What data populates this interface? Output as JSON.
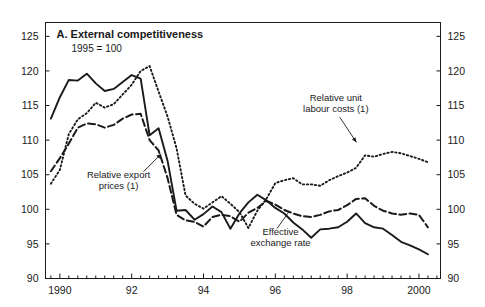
{
  "chart_data": {
    "type": "line",
    "title": "A. External competitiveness",
    "subtitle": "1995 = 100",
    "xlabel": "",
    "ylabel": "",
    "xlim": [
      1989.6,
      2000.6
    ],
    "ylim": [
      90,
      127
    ],
    "y_ticks": [
      90,
      95,
      100,
      105,
      110,
      115,
      120,
      125
    ],
    "y_tick_labels": [
      "90",
      "95",
      "100",
      "105",
      "110",
      "115",
      "120",
      "125"
    ],
    "x_ticks": [
      1990,
      1992,
      1994,
      1996,
      1998,
      2000
    ],
    "x_tick_labels": [
      "1990",
      "92",
      "94",
      "96",
      "98",
      "2000"
    ],
    "x_minor_step": 0.25,
    "grid": false,
    "legend_position": "inline-annotations",
    "dual_y_axis": true,
    "x": [
      1989.75,
      1990.0,
      1990.25,
      1990.5,
      1990.75,
      1991.0,
      1991.25,
      1991.5,
      1991.75,
      1992.0,
      1992.25,
      1992.5,
      1992.75,
      1993.0,
      1993.25,
      1993.5,
      1993.75,
      1994.0,
      1994.25,
      1994.5,
      1994.75,
      1995.0,
      1995.25,
      1995.5,
      1995.75,
      1996.0,
      1996.25,
      1996.5,
      1996.75,
      1997.0,
      1997.25,
      1997.5,
      1997.75,
      1998.0,
      1998.25,
      1998.5,
      1998.75,
      1999.0,
      1999.25,
      1999.5,
      1999.75,
      2000.0,
      2000.25
    ],
    "series": [
      {
        "name": "Effective exchange rate",
        "style": "solid",
        "values": [
          113.1,
          116.2,
          118.7,
          118.6,
          119.6,
          118.2,
          117.1,
          117.4,
          118.4,
          119.4,
          118.9,
          110.7,
          111.7,
          107.0,
          99.8,
          99.9,
          98.5,
          99.3,
          100.4,
          99.6,
          97.2,
          99.4,
          101.0,
          102.1,
          101.3,
          100.2,
          99.4,
          98.1,
          97.1,
          95.9,
          97.1,
          97.2,
          97.4,
          98.2,
          99.4,
          98.0,
          97.4,
          97.2,
          96.3,
          95.3,
          94.8,
          94.2,
          93.5
        ]
      },
      {
        "name": "Relative unit labour costs (1)",
        "style": "dotted",
        "values": [
          103.7,
          105.7,
          110.9,
          113.0,
          113.9,
          115.4,
          114.7,
          115.2,
          116.6,
          118.0,
          120.0,
          120.7,
          117.0,
          113.4,
          108.8,
          102.0,
          100.8,
          100.1,
          101.0,
          101.9,
          100.8,
          99.6,
          97.3,
          99.8,
          101.5,
          103.8,
          104.2,
          104.5,
          103.6,
          103.6,
          103.4,
          104.2,
          104.8,
          105.3,
          106.0,
          107.8,
          107.6,
          108.0,
          108.3,
          108.1,
          107.7,
          107.3,
          106.8
        ]
      },
      {
        "name": "Relative export prices (1)",
        "style": "dashed",
        "values": [
          105.5,
          107.4,
          109.5,
          111.8,
          112.4,
          112.3,
          111.8,
          112.2,
          113.1,
          113.7,
          113.8,
          110.0,
          108.5,
          104.5,
          99.2,
          98.4,
          98.2,
          97.5,
          98.9,
          99.2,
          99.0,
          98.2,
          99.5,
          100.2,
          101.2,
          100.7,
          99.9,
          99.4,
          99.0,
          98.9,
          99.2,
          99.7,
          99.9,
          100.6,
          101.5,
          101.6,
          100.5,
          99.8,
          99.4,
          99.2,
          99.4,
          99.2,
          97.4
        ]
      }
    ],
    "annotations": [
      {
        "id": "relative-unit-labour-costs",
        "lines": [
          "Relative unit",
          "labour costs (1)"
        ],
        "text_x": 0.735,
        "text_y": 0.305,
        "align": "middle",
        "leader_from_x": 0.745,
        "leader_from_y": 0.37,
        "leader_to_x": 0.787,
        "leader_to_y": 0.468,
        "arrow": true
      },
      {
        "id": "relative-export-prices",
        "lines": [
          "Relative export",
          "prices (1)"
        ],
        "text_x": 0.185,
        "text_y": 0.608,
        "align": "middle",
        "leader_from_x": 0.248,
        "leader_from_y": 0.583,
        "leader_to_x": 0.293,
        "leader_to_y": 0.513,
        "arrow": true
      },
      {
        "id": "effective-exchange-rate",
        "lines": [
          "Effective",
          "exchange rate"
        ],
        "text_x": 0.595,
        "text_y": 0.832,
        "align": "middle",
        "leader_from_x": 0.586,
        "leader_from_y": 0.805,
        "leader_to_x": 0.615,
        "leader_to_y": 0.742,
        "arrow": false
      }
    ],
    "colors": {
      "line": "#1a1a1a",
      "axis": "#1a1a1a",
      "background": "#ffffff"
    }
  }
}
